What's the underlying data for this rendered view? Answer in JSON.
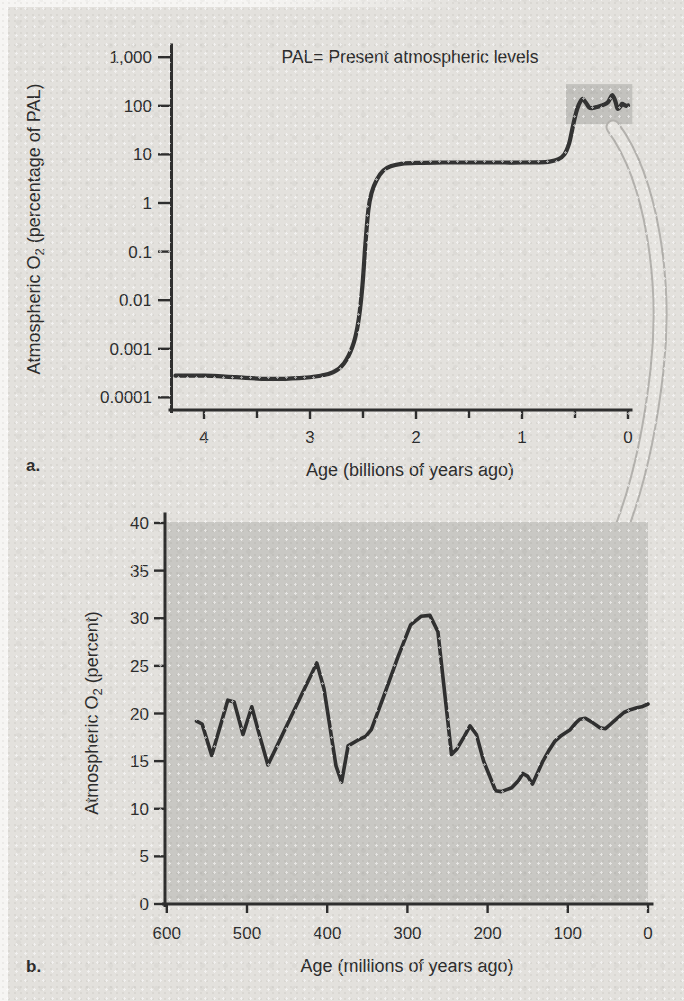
{
  "page": {
    "panel_a_letter": "a.",
    "panel_b_letter": "b."
  },
  "colors": {
    "background": "#e3e1dd",
    "plot_area_gray": "#c9c8c4",
    "highlight_gray": "#c3c2be",
    "curve": "#333333",
    "arrow_gray": "#e7e5e1",
    "arrow_outline": "#b4b2ae"
  },
  "chart_data": [
    {
      "type": "line",
      "id": "oxygen-pal-log-chart",
      "note": "PAL= Present atmospheric levels",
      "xlabel": "Age (billions of years ago)",
      "ylabel_pre": "Atmospheric O",
      "ylabel_sub": "2",
      "ylabel_post": " (percentage of PAL)",
      "yscale": "log",
      "xlim": [
        4.3,
        0
      ],
      "ylim": [
        0.0001,
        1000
      ],
      "x_ticks_major": [
        {
          "v": 4,
          "label": "4"
        },
        {
          "v": 3,
          "label": "3"
        },
        {
          "v": 2,
          "label": "2"
        },
        {
          "v": 1,
          "label": "1"
        },
        {
          "v": 0,
          "label": "0"
        }
      ],
      "x_ticks_minor": [
        3.5,
        2.5,
        1.5,
        0.5
      ],
      "y_ticks": [
        {
          "v": 1000,
          "label": "1,000"
        },
        {
          "v": 100,
          "label": "100"
        },
        {
          "v": 10,
          "label": "10"
        },
        {
          "v": 1,
          "label": "1"
        },
        {
          "v": 0.1,
          "label": "0.1"
        },
        {
          "v": 0.01,
          "label": "0.01"
        },
        {
          "v": 0.001,
          "label": "0.001"
        },
        {
          "v": 0.0001,
          "label": "0.0001"
        }
      ],
      "highlight_region": {
        "age_from": 0.585,
        "age_to": -0.04,
        "pal_from": 42,
        "pal_to": 280
      },
      "series": [
        [
          4.27,
          0.00028
        ],
        [
          4.0,
          0.00028
        ],
        [
          3.7,
          0.00026
        ],
        [
          3.4,
          0.00024
        ],
        [
          3.1,
          0.00025
        ],
        [
          2.9,
          0.00028
        ],
        [
          2.78,
          0.00033
        ],
        [
          2.68,
          0.0005
        ],
        [
          2.6,
          0.0011
        ],
        [
          2.55,
          0.003
        ],
        [
          2.51,
          0.015
        ],
        [
          2.48,
          0.12
        ],
        [
          2.45,
          0.7
        ],
        [
          2.42,
          1.6
        ],
        [
          2.37,
          3.0
        ],
        [
          2.31,
          4.6
        ],
        [
          2.24,
          5.7
        ],
        [
          2.14,
          6.4
        ],
        [
          2.0,
          6.7
        ],
        [
          1.75,
          6.8
        ],
        [
          1.5,
          6.8
        ],
        [
          1.25,
          6.8
        ],
        [
          1.0,
          6.8
        ],
        [
          0.85,
          6.85
        ],
        [
          0.74,
          7.1
        ],
        [
          0.66,
          7.9
        ],
        [
          0.6,
          10
        ],
        [
          0.555,
          17
        ],
        [
          0.52,
          38
        ],
        [
          0.49,
          72
        ],
        [
          0.465,
          105
        ],
        [
          0.43,
          138
        ],
        [
          0.4,
          118
        ],
        [
          0.365,
          92
        ],
        [
          0.33,
          90
        ],
        [
          0.29,
          95
        ],
        [
          0.24,
          103
        ],
        [
          0.19,
          118
        ],
        [
          0.15,
          165
        ],
        [
          0.12,
          125
        ],
        [
          0.1,
          88
        ],
        [
          0.075,
          95
        ],
        [
          0.055,
          110
        ],
        [
          0.035,
          104
        ],
        [
          0.015,
          99
        ],
        [
          0.0,
          102
        ]
      ]
    },
    {
      "type": "line",
      "id": "phanerozoic-oxygen-chart",
      "xlabel": "Age (millions of years ago)",
      "ylabel_pre": "Atmospheric O",
      "ylabel_sub": "2",
      "ylabel_post": " (percent)",
      "yscale": "linear",
      "xlim": [
        600,
        0
      ],
      "ylim": [
        0,
        40
      ],
      "x_ticks": [
        {
          "v": 600,
          "label": "600"
        },
        {
          "v": 500,
          "label": "500"
        },
        {
          "v": 400,
          "label": "400"
        },
        {
          "v": 300,
          "label": "300"
        },
        {
          "v": 200,
          "label": "200"
        },
        {
          "v": 100,
          "label": "100"
        },
        {
          "v": 0,
          "label": "0"
        }
      ],
      "y_ticks": [
        {
          "v": 0,
          "label": "0"
        },
        {
          "v": 5,
          "label": "5"
        },
        {
          "v": 10,
          "label": "10"
        },
        {
          "v": 15,
          "label": "15"
        },
        {
          "v": 20,
          "label": "20"
        },
        {
          "v": 25,
          "label": "25"
        },
        {
          "v": 30,
          "label": "30"
        },
        {
          "v": 35,
          "label": "35"
        },
        {
          "v": 40,
          "label": "40"
        }
      ],
      "series": [
        [
          563,
          19.2
        ],
        [
          556,
          18.9
        ],
        [
          544,
          15.6
        ],
        [
          524,
          21.4
        ],
        [
          516,
          21.2
        ],
        [
          505,
          17.8
        ],
        [
          494,
          20.7
        ],
        [
          486,
          18.2
        ],
        [
          474,
          14.6
        ],
        [
          413,
          25.3
        ],
        [
          404,
          22.6
        ],
        [
          389,
          14.5
        ],
        [
          382,
          12.8
        ],
        [
          374,
          16.6
        ],
        [
          362,
          17.2
        ],
        [
          352,
          17.6
        ],
        [
          345,
          18.3
        ],
        [
          330,
          21.7
        ],
        [
          312,
          25.9
        ],
        [
          296,
          29.3
        ],
        [
          283,
          30.2
        ],
        [
          272,
          30.3
        ],
        [
          262,
          28.6
        ],
        [
          245,
          15.7
        ],
        [
          238,
          16.3
        ],
        [
          229,
          17.6
        ],
        [
          222,
          18.7
        ],
        [
          214,
          17.8
        ],
        [
          205,
          15.0
        ],
        [
          190,
          11.9
        ],
        [
          183,
          11.8
        ],
        [
          170,
          12.2
        ],
        [
          162,
          12.9
        ],
        [
          156,
          13.7
        ],
        [
          150,
          13.4
        ],
        [
          144,
          12.6
        ],
        [
          131,
          15.0
        ],
        [
          123,
          16.2
        ],
        [
          116,
          17.1
        ],
        [
          108,
          17.7
        ],
        [
          97,
          18.3
        ],
        [
          90,
          19.0
        ],
        [
          85,
          19.4
        ],
        [
          78,
          19.5
        ],
        [
          70,
          19.1
        ],
        [
          60,
          18.5
        ],
        [
          53,
          18.4
        ],
        [
          45,
          19.0
        ],
        [
          37,
          19.6
        ],
        [
          30,
          20.1
        ],
        [
          22,
          20.4
        ],
        [
          14,
          20.6
        ],
        [
          8,
          20.7
        ],
        [
          0,
          21.0
        ]
      ]
    }
  ]
}
